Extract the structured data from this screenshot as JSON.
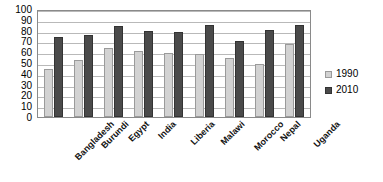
{
  "chart_data": {
    "type": "bar",
    "title": "",
    "subtitle": "",
    "xlabel": "",
    "ylabel": "",
    "ylim": [
      0,
      100
    ],
    "ytick_step": 10,
    "yticks": [
      100,
      90,
      80,
      70,
      60,
      50,
      40,
      30,
      20,
      10,
      0
    ],
    "grid": true,
    "legend_position": "right",
    "categories": [
      "Bangladesh",
      "Burundi",
      "Egypt",
      "India",
      "Liberia",
      "Malawi",
      "Morocco",
      "Nepal",
      "Uganda"
    ],
    "series": [
      {
        "name": "1990",
        "color": "#d2d2d2",
        "values": [
          44,
          53,
          64,
          61,
          59,
          58,
          55,
          49,
          68
        ]
      },
      {
        "name": "2010",
        "color": "#4a4a4a",
        "values": [
          74,
          76,
          84,
          80,
          79,
          85,
          70,
          81,
          85
        ]
      }
    ]
  },
  "legend": {
    "items": [
      {
        "label": "1990"
      },
      {
        "label": "2010"
      }
    ]
  },
  "colors": {
    "series_1990": "#d2d2d2",
    "series_2010": "#4a4a4a",
    "gridline": "#b9b9b9",
    "plot_border": "#8a8a8a",
    "background": "#ffffff",
    "text": "#000000"
  }
}
